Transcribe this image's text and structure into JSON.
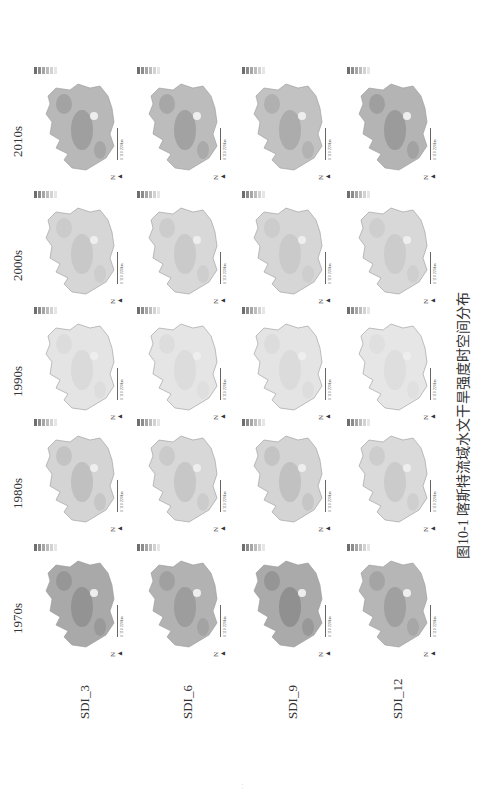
{
  "figure": {
    "caption": "图10-1  喀斯特流域水文干旱强度时空间分布",
    "columns": [
      "1970s",
      "1980s",
      "1990s",
      "2000s",
      "2010s"
    ],
    "rows": [
      "SDI_3",
      "SDI_6",
      "SDI_9",
      "SDI_12"
    ],
    "scale_bar": "0  110  220km",
    "north_arrow": "N",
    "legend_colors": [
      "#6e6e6e",
      "#8c8c8c",
      "#a6a6a6",
      "#bdbdbd",
      "#d2d2d2",
      "#e6e6e6"
    ],
    "panel_intensity": [
      [
        [
          "#8f8f8f",
          "#a9a9a9"
        ],
        [
          "#bcbcbc",
          "#d4d4d4"
        ],
        [
          "#d8d8d8",
          "#e4e4e4"
        ],
        [
          "#c6c6c6",
          "#d6d6d6"
        ],
        [
          "#9a9a9a",
          "#b8b8b8"
        ]
      ],
      [
        [
          "#999999",
          "#b2b2b2"
        ],
        [
          "#c4c4c4",
          "#d8d8d8"
        ],
        [
          "#dadada",
          "#e5e5e5"
        ],
        [
          "#c8c8c8",
          "#d8d8d8"
        ],
        [
          "#9e9e9e",
          "#bcbcbc"
        ]
      ],
      [
        [
          "#8c8c8c",
          "#aaaaaa"
        ],
        [
          "#bdbdbd",
          "#d4d4d4"
        ],
        [
          "#d9d9d9",
          "#e4e4e4"
        ],
        [
          "#c8c8c8",
          "#d6d6d6"
        ],
        [
          "#a8a8a8",
          "#c2c2c2"
        ]
      ],
      [
        [
          "#9c9c9c",
          "#b6b6b6"
        ],
        [
          "#c8c8c8",
          "#dadada"
        ],
        [
          "#dcdcdc",
          "#e6e6e6"
        ],
        [
          "#cacaca",
          "#d8d8d8"
        ],
        [
          "#969696",
          "#b4b4b4"
        ]
      ]
    ]
  },
  "page_number": "· ·"
}
